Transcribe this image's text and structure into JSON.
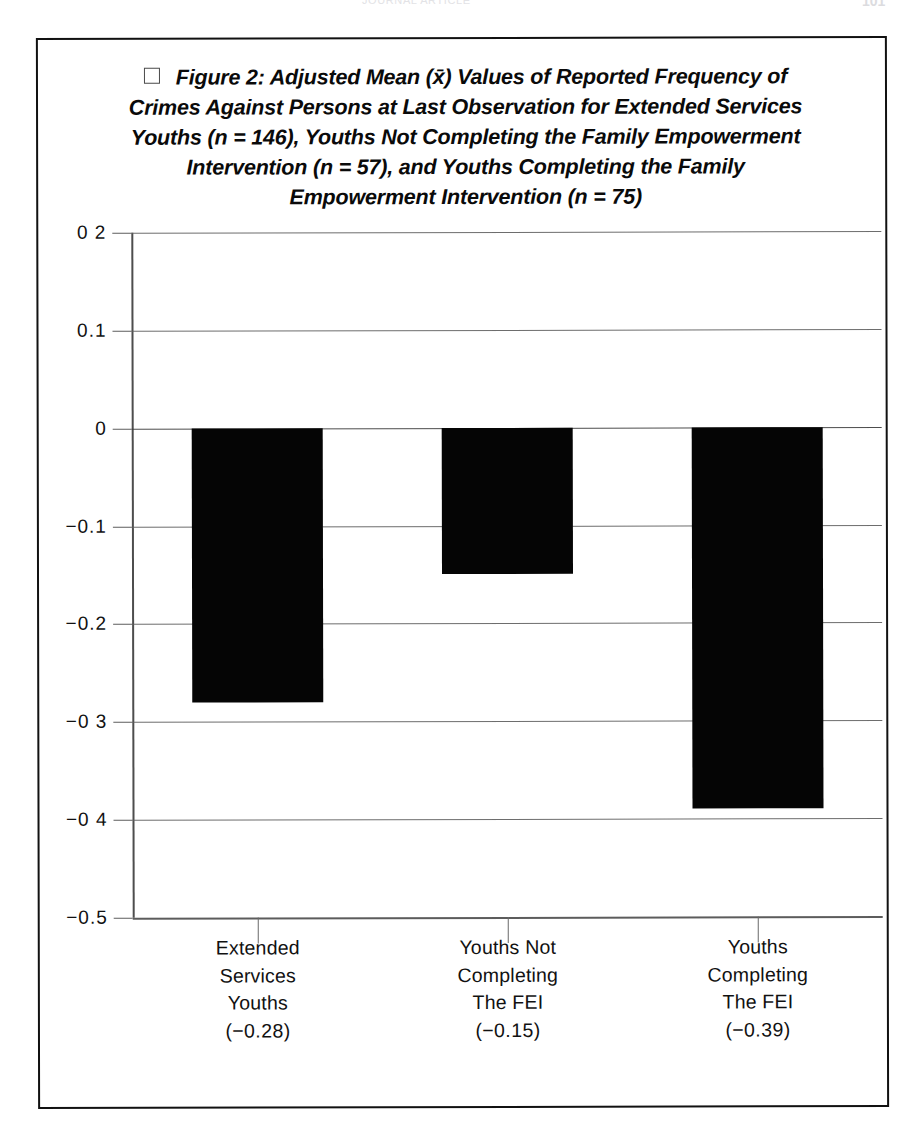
{
  "page": {
    "running_head": "JOURNAL ARTICLE",
    "page_number": "101"
  },
  "figure": {
    "box_glyph": "□",
    "title_lines": [
      "Figure 2: Adjusted Mean (x̄) Values of Reported Frequency of",
      "Crimes Against Persons at Last Observation for Extended Services",
      "Youths (n = 146), Youths Not Completing the Family Empowerment",
      "Intervention (n = 57), and Youths Completing the  Family",
      "Empowerment Intervention  (n = 75)"
    ]
  },
  "chart_data": {
    "type": "bar",
    "xlabel": "",
    "ylabel": "",
    "categories": [
      "Extended Services Youths",
      "Youths Not Completing The FEI",
      "Youths Completing The FEI"
    ],
    "category_lines": [
      [
        "Extended",
        "Services",
        "Youths"
      ],
      [
        "Youths Not",
        "Completing",
        "The FEI"
      ],
      [
        "Youths",
        "Completing",
        "The FEI"
      ]
    ],
    "category_value_labels": [
      "(−0.28)",
      "(−0.15)",
      "(−0.39)"
    ],
    "values": [
      -0.28,
      -0.15,
      -0.39
    ],
    "group_sizes": [
      146,
      57,
      75
    ],
    "ylim": [
      -0.5,
      0.2
    ],
    "ytick_values": [
      0.2,
      0.1,
      0,
      -0.1,
      -0.2,
      -0.3,
      -0.4,
      -0.5
    ],
    "ytick_labels": [
      "0 2",
      "0.1",
      "0",
      "−0.1",
      "−0.2",
      "−0 3",
      "−0 4",
      "−0.5"
    ],
    "grid": true,
    "legend": "none",
    "bar_color": "#050505"
  }
}
